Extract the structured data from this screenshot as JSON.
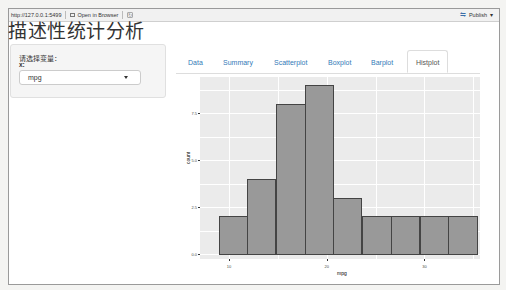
{
  "toolbar": {
    "url": "http://127.0.0.1:5499",
    "open_in_browser": "Open in Browser",
    "publish": "Publish"
  },
  "page_title": "描述性统计分析",
  "sidebar": {
    "prompt_label": "请选择变量：",
    "x_label": "x:",
    "select_value": "mpg"
  },
  "tabs": [
    {
      "label": "Data",
      "active": false
    },
    {
      "label": "Summary",
      "active": false
    },
    {
      "label": "Scatterplot",
      "active": false
    },
    {
      "label": "Boxplot",
      "active": false
    },
    {
      "label": "Barplot",
      "active": false
    },
    {
      "label": "Histplot",
      "active": true
    }
  ],
  "colors": {
    "link": "#337ab7",
    "panel_bg": "#ebebeb",
    "bar_fill": "#999999",
    "bar_border": "#444444"
  },
  "chart_data": {
    "type": "bar",
    "title": "",
    "xlabel": "mpg",
    "ylabel": "count",
    "x_ticks": [
      "10",
      "20",
      "30"
    ],
    "y_ticks": [
      "0.0",
      "2.5",
      "5.0",
      "7.5"
    ],
    "ylim": [
      0,
      9.4
    ],
    "bin_centers": [
      10.4,
      13.3,
      16.3,
      19.2,
      22.1,
      25.1,
      28.0,
      31.0,
      33.9
    ],
    "values": [
      2,
      4,
      8,
      9,
      3,
      2,
      2,
      2,
      2
    ],
    "grid": true
  }
}
